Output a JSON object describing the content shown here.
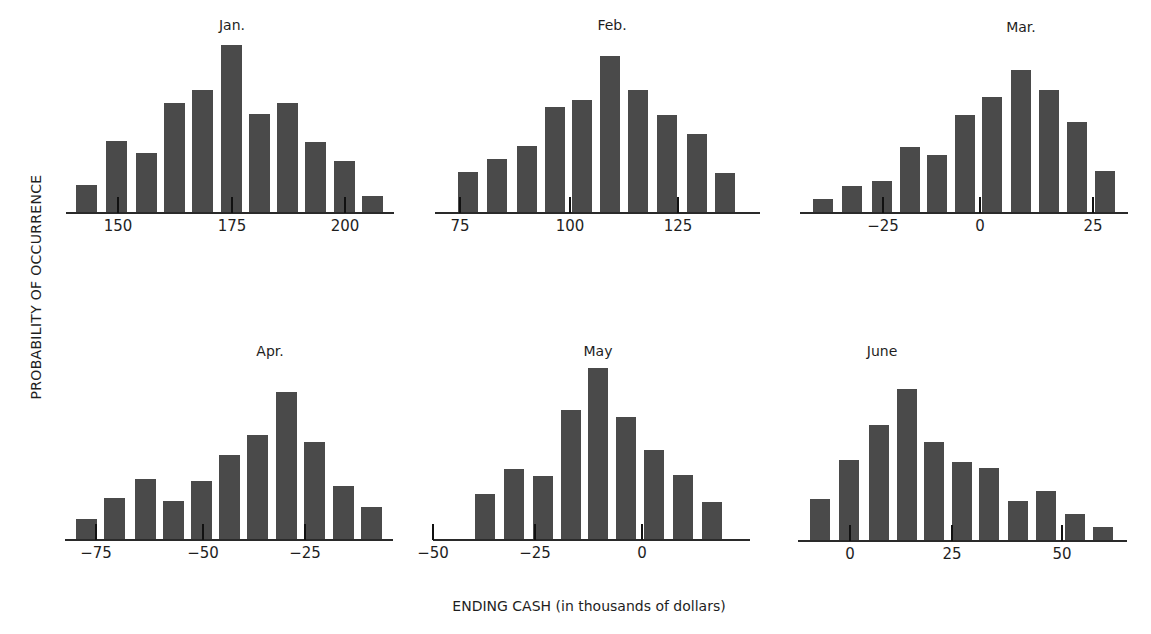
{
  "figure": {
    "ylabel": "PROBABILITY OF OCCURRENCE",
    "xlabel": "ENDING CASH (in thousands of dollars)",
    "bar_color": "#4a4a4a",
    "axis_color": "#2a2a2a"
  },
  "panels": [
    {
      "title": "Jan.",
      "title_pos": [
        232,
        17
      ],
      "baseline_y": 212,
      "axis": [
        66,
        394
      ],
      "bar_width": 21,
      "bar_lefts": [
        76,
        106,
        136,
        164,
        192,
        221,
        249,
        277,
        305,
        334,
        362
      ],
      "bar_heights": [
        27,
        71,
        59,
        109,
        122,
        167,
        98,
        109,
        70,
        51,
        16
      ],
      "ticks": [
        {
          "x": 118,
          "label": "150"
        },
        {
          "x": 232,
          "label": "175"
        },
        {
          "x": 345,
          "label": "200"
        }
      ]
    },
    {
      "title": "Feb.",
      "title_pos": [
        612,
        17
      ],
      "baseline_y": 212,
      "axis": [
        435,
        760
      ],
      "bar_width": 20,
      "bar_lefts": [
        458,
        487,
        517,
        545,
        572,
        600,
        628,
        657,
        687,
        715
      ],
      "bar_heights": [
        40,
        53,
        66,
        105,
        112,
        156,
        122,
        97,
        78,
        39
      ],
      "ticks": [
        {
          "x": 460,
          "label": "75"
        },
        {
          "x": 570,
          "label": "100"
        },
        {
          "x": 678,
          "label": "125"
        }
      ]
    },
    {
      "title": "Mar.",
      "title_pos": [
        1021,
        19
      ],
      "baseline_y": 212,
      "axis": [
        800,
        1128
      ],
      "bar_width": 20,
      "bar_lefts": [
        813,
        842,
        872,
        900,
        927,
        955,
        982,
        1011,
        1039,
        1067,
        1095
      ],
      "bar_heights": [
        13,
        26,
        31,
        65,
        57,
        97,
        115,
        142,
        122,
        90,
        41
      ],
      "ticks": [
        {
          "x": 883,
          "label": "−25"
        },
        {
          "x": 980,
          "label": "0"
        },
        {
          "x": 1093,
          "label": "25"
        }
      ]
    },
    {
      "title": "Apr.",
      "title_pos": [
        270,
        343
      ],
      "baseline_y": 539,
      "axis": [
        65,
        393
      ],
      "bar_width": 21,
      "bar_lefts": [
        76,
        104,
        135,
        163,
        191,
        219,
        247,
        276,
        304,
        333,
        361
      ],
      "bar_heights": [
        20,
        41,
        60,
        38,
        58,
        84,
        104,
        147,
        97,
        53,
        32
      ],
      "ticks": [
        {
          "x": 96,
          "label": "−75"
        },
        {
          "x": 203,
          "label": "−50"
        },
        {
          "x": 305,
          "label": "−25"
        }
      ]
    },
    {
      "title": "May",
      "title_pos": [
        598,
        343
      ],
      "baseline_y": 539,
      "axis": [
        433,
        750
      ],
      "bar_width": 20,
      "bar_lefts": [
        475,
        504,
        533,
        561,
        588,
        616,
        644,
        673,
        702
      ],
      "bar_heights": [
        45,
        70,
        63,
        129,
        171,
        122,
        89,
        64,
        37
      ],
      "ticks": [
        {
          "x": 433,
          "label": "−50"
        },
        {
          "x": 535,
          "label": "−25"
        },
        {
          "x": 642,
          "label": "0"
        }
      ]
    },
    {
      "title": "June",
      "title_pos": [
        882,
        343
      ],
      "baseline_y": 540,
      "axis": [
        798,
        1127
      ],
      "bar_width": 20,
      "bar_lefts": [
        810,
        839,
        869,
        897,
        924,
        952,
        979,
        1008,
        1036,
        1065,
        1093
      ],
      "bar_heights": [
        41,
        80,
        115,
        151,
        98,
        78,
        72,
        39,
        49,
        26,
        13
      ],
      "ticks": [
        {
          "x": 850,
          "label": "0"
        },
        {
          "x": 952,
          "label": "25"
        },
        {
          "x": 1062,
          "label": "50"
        }
      ]
    }
  ],
  "chart_data": [
    {
      "type": "bar",
      "title": "Jan.",
      "xlabel": "ENDING CASH (in thousands of dollars)",
      "ylabel": "PROBABILITY OF OCCURRENCE",
      "x": [
        143,
        149.6,
        156.2,
        162.4,
        168.6,
        174.9,
        181.1,
        187.3,
        193.6,
        199.8,
        206.1
      ],
      "values": [
        27,
        71,
        59,
        109,
        122,
        167,
        98,
        109,
        70,
        51,
        16
      ],
      "value_units": "relative probability (bar height, unitless)",
      "xticks": [
        150,
        175,
        200
      ],
      "grid": false
    },
    {
      "type": "bar",
      "title": "Feb.",
      "xlabel": "ENDING CASH (in thousands of dollars)",
      "ylabel": "PROBABILITY OF OCCURRENCE",
      "x": [
        76.8,
        83.4,
        90.3,
        96.9,
        103,
        109.4,
        115.8,
        122.4,
        129.3,
        135.8
      ],
      "values": [
        40,
        53,
        66,
        105,
        112,
        156,
        122,
        97,
        78,
        39
      ],
      "value_units": "relative probability (bar height, unitless)",
      "xticks": [
        75,
        100,
        125
      ],
      "grid": false
    },
    {
      "type": "bar",
      "title": "Mar.",
      "xlabel": "ENDING CASH (in thousands of dollars)",
      "ylabel": "PROBABILITY OF OCCURRENCE",
      "x": [
        -34.7,
        -28.4,
        -21.7,
        -15.4,
        -9.5,
        -3.4,
        2.7,
        9.1,
        15.3,
        21.5,
        27.7
      ],
      "values": [
        13,
        26,
        31,
        65,
        57,
        97,
        115,
        142,
        122,
        90,
        41
      ],
      "value_units": "relative probability (bar height, unitless)",
      "xticks": [
        -25,
        0,
        25
      ],
      "grid": false
    },
    {
      "type": "bar",
      "title": "Apr.",
      "xlabel": "ENDING CASH (in thousands of dollars)",
      "ylabel": "PROBABILITY OF OCCURRENCE",
      "x": [
        -77.5,
        -70.7,
        -63.4,
        -56.5,
        -50,
        -43.3,
        -36.6,
        -29.7,
        -22.8,
        -16,
        -9.3
      ],
      "values": [
        20,
        41,
        60,
        38,
        58,
        84,
        104,
        147,
        97,
        53,
        32
      ],
      "value_units": "relative probability (bar height, unitless)",
      "xticks": [
        -75,
        -50,
        -25
      ],
      "grid": false
    },
    {
      "type": "bar",
      "title": "May",
      "xlabel": "ENDING CASH (in thousands of dollars)",
      "ylabel": "PROBABILITY OF OCCURRENCE",
      "x": [
        -37.5,
        -30.6,
        -23.6,
        -17,
        -10.4,
        -3.8,
        2.9,
        9.9,
        16.7
      ],
      "values": [
        45,
        70,
        63,
        129,
        171,
        122,
        89,
        64,
        37
      ],
      "value_units": "relative probability (bar height, unitless)",
      "xticks": [
        -50,
        -25,
        0
      ],
      "grid": false
    },
    {
      "type": "bar",
      "title": "June",
      "xlabel": "ENDING CASH (in thousands of dollars)",
      "ylabel": "PROBABILITY OF OCCURRENCE",
      "x": [
        -7.1,
        -0.3,
        6.9,
        13.5,
        19.8,
        26.4,
        32.9,
        39.8,
        46.3,
        53.3,
        59.9
      ],
      "values": [
        41,
        80,
        115,
        151,
        98,
        78,
        72,
        39,
        49,
        26,
        13
      ],
      "value_units": "relative probability (bar height, unitless)",
      "xticks": [
        0,
        25,
        50
      ],
      "grid": false
    }
  ]
}
